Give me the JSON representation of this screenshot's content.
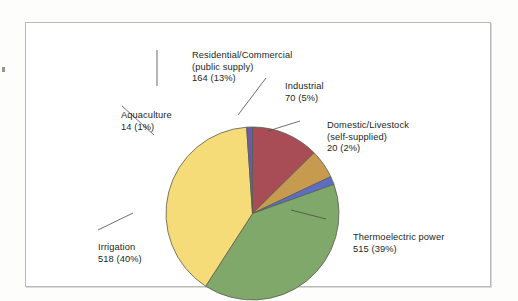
{
  "figure": {
    "background_color": "#ffffff",
    "frame_color": "#b9b9b9",
    "text_color": "#231f1e"
  },
  "chart_data": {
    "type": "pie",
    "title": "",
    "subtitle": "",
    "xlabel": "",
    "ylabel": "",
    "grid": false,
    "legend_position": "none",
    "units_note": "",
    "total_value": 1301,
    "total_percent": 100,
    "categories": [
      "Residential/Commercial (public supply)",
      "Industrial",
      "Domestic/Livestock (self-supplied)",
      "Thermoelectric power",
      "Irrigation",
      "Aquaculture"
    ],
    "values": [
      164,
      70,
      20,
      515,
      518,
      14
    ],
    "percents": [
      13,
      5,
      2,
      39,
      40,
      1
    ],
    "colors": [
      "#a84d55",
      "#c69a4f",
      "#5b6ec4",
      "#7fa86a",
      "#f5dc78",
      "#6b5aa8"
    ],
    "slices": [
      {
        "name": "Residential/Commercial (public supply)",
        "label_line1": "Residential/Commercial",
        "label_line2": "(public supply)",
        "label_line3": "164 (13%)",
        "value": 164,
        "percent": 13,
        "color": "#a84d55",
        "start_angle_deg": 0,
        "end_angle_deg": 45.4
      },
      {
        "name": "Industrial",
        "label_line1": "Industrial",
        "label_line2": "70 (5%)",
        "label_line3": "",
        "value": 70,
        "percent": 5,
        "color": "#c69a4f",
        "start_angle_deg": 45.4,
        "end_angle_deg": 64.8
      },
      {
        "name": "Domestic/Livestock (self-supplied)",
        "label_line1": "Domestic/Livestock",
        "label_line2": "(self-supplied)",
        "label_line3": "20 (2%)",
        "value": 20,
        "percent": 2,
        "color": "#5b6ec4",
        "start_angle_deg": 64.8,
        "end_angle_deg": 70.3
      },
      {
        "name": "Thermoelectric power",
        "label_line1": "Thermoelectric power",
        "label_line2": "515 (39%)",
        "label_line3": "",
        "value": 515,
        "percent": 39,
        "color": "#7fa86a",
        "start_angle_deg": 70.3,
        "end_angle_deg": 212.8
      },
      {
        "name": "Irrigation",
        "label_line1": "Irrigation",
        "label_line2": "518 (40%)",
        "label_line3": "",
        "value": 518,
        "percent": 40,
        "color": "#f5dc78",
        "start_angle_deg": 212.8,
        "end_angle_deg": 356.1
      },
      {
        "name": "Aquaculture",
        "label_line1": "Aquaculture",
        "label_line2": "14 (1%)",
        "label_line3": "",
        "value": 14,
        "percent": 1,
        "color": "#6b5aa8",
        "start_angle_deg": 356.1,
        "end_angle_deg": 360
      }
    ]
  }
}
